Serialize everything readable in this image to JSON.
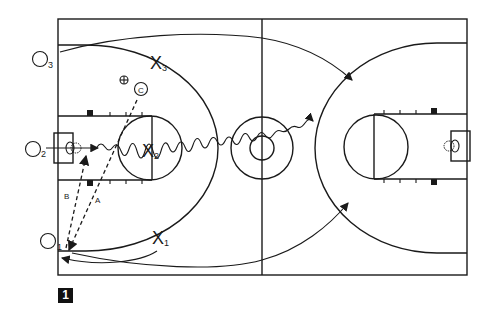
{
  "figure": {
    "number": "1"
  },
  "players": {
    "offense": [
      {
        "id": "O1",
        "symbol": "O",
        "sub": "1"
      },
      {
        "id": "O2",
        "symbol": "O",
        "sub": "2"
      },
      {
        "id": "O3",
        "symbol": "O",
        "sub": "3"
      }
    ],
    "defense": [
      {
        "id": "X1",
        "symbol": "X",
        "sub": "1"
      },
      {
        "id": "X2",
        "symbol": "X",
        "sub": "2"
      },
      {
        "id": "X3",
        "symbol": "X",
        "sub": "3"
      }
    ],
    "coach": {
      "symbol": "C"
    }
  },
  "pass_labels": {
    "a": "A",
    "b": "B"
  },
  "colors": {
    "ink": "#1a1a1a",
    "background": "#ffffff"
  }
}
